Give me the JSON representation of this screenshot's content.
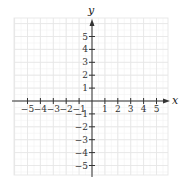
{
  "diagram": {
    "type": "coordinate-grid",
    "x_axis": {
      "label": "x",
      "min": -6,
      "max": 6,
      "ticks": [
        -5,
        -4,
        -3,
        -2,
        -1,
        1,
        2,
        3,
        4,
        5
      ],
      "tick_labels": [
        "−5",
        "−4",
        "−3",
        "−2",
        "−1",
        "1",
        "2",
        "3",
        "4",
        "5"
      ]
    },
    "y_axis": {
      "label": "y",
      "min": -6,
      "max": 6,
      "ticks": [
        5,
        4,
        3,
        2,
        1,
        -1,
        -2,
        -3,
        -4,
        -5
      ],
      "tick_labels": [
        "5",
        "4",
        "3",
        "2",
        "1",
        "−1",
        "−2",
        "−3",
        "−4",
        "−5"
      ]
    },
    "grid": {
      "on": true,
      "color": "#e6e6e6",
      "fine_color": "#f2f2f2"
    },
    "axis_color": "#333333"
  }
}
